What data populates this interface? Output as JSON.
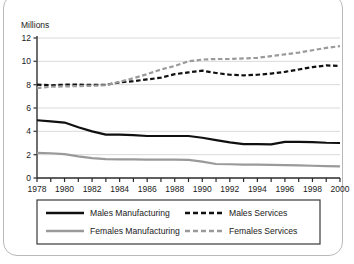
{
  "chart_data": {
    "type": "line",
    "title": "",
    "subtitle": "",
    "xlabel": "",
    "ylabel": "Millions",
    "ylim": [
      0,
      12
    ],
    "xlim": [
      1978,
      2000
    ],
    "yticks": [
      0,
      2,
      4,
      6,
      8,
      10,
      12
    ],
    "ytick_labels": [
      "0",
      "2",
      "4",
      "6",
      "8",
      "10",
      "12"
    ],
    "x": [
      1978,
      1979,
      1980,
      1981,
      1982,
      1983,
      1984,
      1985,
      1986,
      1987,
      1988,
      1989,
      1990,
      1991,
      1992,
      1993,
      1994,
      1995,
      1996,
      1997,
      1998,
      1999,
      2000
    ],
    "xtick_labels": [
      "1978",
      "1980",
      "1982",
      "1984",
      "1986",
      "1988",
      "1990",
      "1992",
      "1994",
      "1996",
      "1998",
      "2000"
    ],
    "xtick_values": [
      1978,
      1980,
      1982,
      1984,
      1986,
      1988,
      1990,
      1992,
      1994,
      1996,
      1998,
      2000
    ],
    "grid": true,
    "grid_axis": "y",
    "legend_position": "bottom",
    "series": [
      {
        "name": "Males Manufacturing",
        "color": "#101010",
        "style": "solid",
        "width": 2.2,
        "values": [
          4.95,
          4.85,
          4.75,
          4.35,
          4.0,
          3.72,
          3.72,
          3.68,
          3.6,
          3.6,
          3.6,
          3.6,
          3.45,
          3.25,
          3.05,
          2.9,
          2.9,
          2.88,
          3.1,
          3.1,
          3.08,
          3.02,
          3.0
        ]
      },
      {
        "name": "Males Services",
        "color": "#101010",
        "style": "dashed",
        "width": 2.2,
        "values": [
          8.0,
          7.95,
          8.0,
          8.0,
          7.98,
          7.98,
          8.2,
          8.3,
          8.45,
          8.6,
          8.9,
          9.05,
          9.2,
          9.0,
          8.85,
          8.8,
          8.85,
          8.95,
          9.1,
          9.3,
          9.5,
          9.65,
          9.6
        ]
      },
      {
        "name": "Females Manufacturing",
        "color": "#9a9a9a",
        "style": "solid",
        "width": 2.2,
        "values": [
          2.15,
          2.12,
          2.05,
          1.85,
          1.7,
          1.62,
          1.6,
          1.6,
          1.58,
          1.58,
          1.58,
          1.55,
          1.4,
          1.2,
          1.18,
          1.15,
          1.15,
          1.12,
          1.1,
          1.08,
          1.05,
          1.02,
          1.0
        ]
      },
      {
        "name": "Females Services",
        "color": "#9a9a9a",
        "style": "dashed",
        "width": 2.2,
        "values": [
          7.7,
          7.82,
          7.85,
          7.88,
          7.9,
          7.95,
          8.25,
          8.55,
          8.9,
          9.3,
          9.6,
          10.0,
          10.15,
          10.2,
          10.2,
          10.25,
          10.3,
          10.45,
          10.6,
          10.75,
          10.95,
          11.15,
          11.3
        ]
      }
    ]
  },
  "legend": {
    "items": [
      {
        "label": "Males Manufacturing",
        "swatch": "solid-black-line-icon"
      },
      {
        "label": "Males Services",
        "swatch": "dashed-black-line-icon"
      },
      {
        "label": "Females Manufacturing",
        "swatch": "solid-gray-line-icon"
      },
      {
        "label": "Females Services",
        "swatch": "dashed-gray-line-icon"
      }
    ]
  },
  "colors": {
    "male": "#101010",
    "female": "#9a9a9a",
    "grid": "#d9d9d9",
    "axis": "#4a4a4a",
    "frame": "#b9b9b9"
  }
}
